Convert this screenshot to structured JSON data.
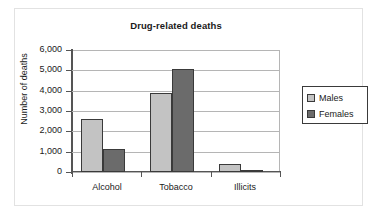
{
  "chart_data": {
    "type": "bar",
    "title": "Drug-related deaths",
    "xlabel": "",
    "ylabel": "Number of deaths",
    "categories": [
      "Alcohol",
      "Tobacco",
      "Illicits"
    ],
    "series": [
      {
        "name": "Males",
        "values": [
          2600,
          3870,
          400
        ],
        "color": "#c3c3c3"
      },
      {
        "name": "Females",
        "values": [
          1150,
          5080,
          100
        ],
        "color": "#6b6b6b"
      }
    ],
    "ylim": [
      0,
      6000
    ],
    "ytick_labels": [
      "6,000",
      "5,000",
      "4,000",
      "3,000",
      "2,000",
      "1,000",
      "0"
    ],
    "ytick_values": [
      6000,
      5000,
      4000,
      3000,
      2000,
      1000,
      0
    ],
    "grid": true,
    "legend_position": "right"
  },
  "colors": {
    "males": "#c3c3c3",
    "females": "#6b6b6b",
    "bar_outline": "#3a3a3a",
    "gridline": "#b5b5b5",
    "axis": "#555555",
    "frame": "#e2e2e2",
    "text": "#1a1a1a",
    "background": "#ffffff"
  },
  "legend": {
    "entries": [
      {
        "label": "Males"
      },
      {
        "label": "Females"
      }
    ]
  }
}
